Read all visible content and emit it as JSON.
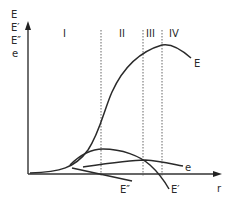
{
  "diagram": {
    "y_axis_labels": [
      "E",
      "E′",
      "E″",
      "e"
    ],
    "x_axis_label": "r",
    "regions": [
      {
        "label": "I",
        "x": 65
      },
      {
        "label": "II",
        "x": 123
      },
      {
        "label": "III",
        "x": 152
      },
      {
        "label": "IV",
        "x": 176
      }
    ],
    "region_boundaries_x": [
      101,
      143,
      162
    ],
    "curves": [
      {
        "name": "E",
        "label": "E"
      },
      {
        "name": "E_prime",
        "label": "E′"
      },
      {
        "name": "E_double_prime",
        "label": "E″"
      },
      {
        "name": "e",
        "label": "e"
      }
    ],
    "colors": {
      "line": "#2a2a2a",
      "axis": "#333333",
      "dashed": "#555555"
    }
  }
}
